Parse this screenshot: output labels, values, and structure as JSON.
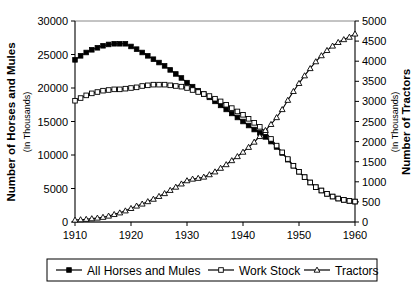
{
  "chart_data": {
    "type": "line",
    "title": "",
    "xlabel": "",
    "ylabel": "Number of Horses and Mules",
    "ylabel_sub": "(In Thousands)",
    "y2label": "Number of Tractors",
    "y2label_sub": "(In Thousands)",
    "grid": false,
    "legend_position": "bottom",
    "xlim": [
      1910,
      1960
    ],
    "ylim": [
      0,
      30000
    ],
    "y2lim": [
      0,
      5000
    ],
    "xticks": [
      1910,
      1920,
      1930,
      1940,
      1950,
      1960
    ],
    "xtick_labels": [
      "1910",
      "1920",
      "1930",
      "1940",
      "1950",
      "1960"
    ],
    "yticks": [
      0,
      5000,
      10000,
      15000,
      20000,
      25000,
      30000
    ],
    "ytick_labels": [
      "0",
      "5000",
      "10000",
      "15000",
      "20000",
      "25000",
      "30000"
    ],
    "y2ticks": [
      0,
      500,
      1000,
      1500,
      2000,
      2500,
      3000,
      3500,
      4000,
      4500,
      5000
    ],
    "y2tick_labels": [
      "0",
      "500",
      "1000",
      "1500",
      "2000",
      "2500",
      "3000",
      "3500",
      "4000",
      "4500",
      "5000"
    ],
    "x": [
      1910,
      1911,
      1912,
      1913,
      1914,
      1915,
      1916,
      1917,
      1918,
      1919,
      1920,
      1921,
      1922,
      1923,
      1924,
      1925,
      1926,
      1927,
      1928,
      1929,
      1930,
      1931,
      1932,
      1933,
      1934,
      1935,
      1936,
      1937,
      1938,
      1939,
      1940,
      1941,
      1942,
      1943,
      1944,
      1945,
      1946,
      1947,
      1948,
      1949,
      1950,
      1951,
      1952,
      1953,
      1954,
      1955,
      1956,
      1957,
      1958,
      1959,
      1960
    ],
    "series": [
      {
        "name": "All Horses and Mules",
        "axis": "left",
        "marker": "filled-square",
        "values": [
          24200,
          24800,
          25300,
          25700,
          26000,
          26300,
          26500,
          26600,
          26600,
          26600,
          26200,
          25800,
          25300,
          24800,
          24300,
          23800,
          23300,
          22700,
          22100,
          21500,
          20800,
          20200,
          19600,
          19100,
          18600,
          18000,
          17400,
          16800,
          16200,
          15600,
          15000,
          14400,
          13800,
          13300,
          12700,
          12000,
          11200,
          10300,
          9300,
          8400,
          7500,
          6700,
          5900,
          5200,
          4700,
          4200,
          3800,
          3500,
          3300,
          3150,
          3050
        ]
      },
      {
        "name": "Work Stock",
        "axis": "left",
        "marker": "open-square",
        "values": [
          18100,
          18500,
          18900,
          19200,
          19400,
          19600,
          19700,
          19800,
          19800,
          19900,
          20000,
          20100,
          20300,
          20400,
          20500,
          20500,
          20500,
          20400,
          20300,
          20200,
          20000,
          19700,
          19400,
          19100,
          18800,
          18400,
          18000,
          17500,
          17000,
          16500,
          16000,
          15400,
          14800,
          14200,
          13400,
          12400,
          11400,
          10400,
          9400,
          8400,
          7500,
          6700,
          5900,
          5200,
          4700,
          4200,
          3800,
          3500,
          3300,
          3150,
          3050
        ]
      },
      {
        "name": "Tractors",
        "axis": "right",
        "marker": "open-triangle",
        "values": [
          50,
          60,
          70,
          85,
          100,
          120,
          150,
          190,
          230,
          280,
          340,
          400,
          450,
          510,
          570,
          640,
          710,
          790,
          870,
          950,
          1030,
          1070,
          1090,
          1120,
          1180,
          1250,
          1340,
          1430,
          1530,
          1630,
          1740,
          1860,
          1990,
          2130,
          2280,
          2430,
          2600,
          2800,
          3030,
          3250,
          3450,
          3640,
          3820,
          3990,
          4140,
          4270,
          4380,
          4470,
          4540,
          4600,
          4680
        ]
      }
    ],
    "legend_entries": [
      {
        "label": "All Horses and Mules",
        "marker": "filled-square"
      },
      {
        "label": "Work Stock",
        "marker": "open-square"
      },
      {
        "label": "Tractors",
        "marker": "open-triangle"
      }
    ]
  }
}
